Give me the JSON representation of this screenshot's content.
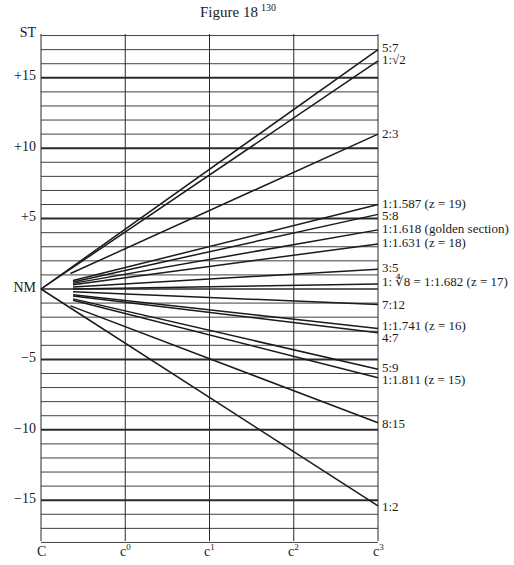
{
  "figure": {
    "title": "Figure 18",
    "page_number": "130"
  },
  "y_axis": {
    "labels": [
      {
        "text": "ST",
        "value": 18
      },
      {
        "text": "+15",
        "value": 15
      },
      {
        "text": "+10",
        "value": 10
      },
      {
        "text": "+5",
        "value": 5
      },
      {
        "text": "NM",
        "value": 0
      },
      {
        "text": "−5",
        "value": -5
      },
      {
        "text": "−10",
        "value": -10
      },
      {
        "text": "−15",
        "value": -15
      }
    ]
  },
  "x_axis": {
    "labels": [
      {
        "base": "C",
        "sup": ""
      },
      {
        "base": "c",
        "sup": "0"
      },
      {
        "base": "c",
        "sup": "1"
      },
      {
        "base": "c",
        "sup": "2"
      },
      {
        "base": "c",
        "sup": "3"
      }
    ]
  },
  "chart_data": {
    "type": "line",
    "title": "Figure 18",
    "xlabel": "",
    "ylabel": "",
    "x_ticks": [
      "C",
      "c0",
      "c1",
      "c2",
      "c3"
    ],
    "y_ticks": [
      "ST",
      "+15",
      "+10",
      "+5",
      "NM",
      "-5",
      "-10",
      "-15"
    ],
    "ylim": [
      -18,
      18
    ],
    "grid": true,
    "series": [
      {
        "name": "5:7",
        "start": [
          0,
          0
        ],
        "end": [
          4,
          17.0
        ]
      },
      {
        "name": "1:√2",
        "start": [
          0,
          0
        ],
        "end": [
          4,
          16.2
        ]
      },
      {
        "name": "2:3",
        "start": [
          0.35,
          1.1
        ],
        "end": [
          4,
          11.0
        ]
      },
      {
        "name": "1:1.587 (z = 19)",
        "start": [
          0.38,
          0.6
        ],
        "end": [
          4,
          6.0
        ]
      },
      {
        "name": "5:8",
        "start": [
          0.38,
          0.5
        ],
        "end": [
          4,
          5.3
        ]
      },
      {
        "name": "1:1.618 (golden section)",
        "start": [
          0.38,
          0.4
        ],
        "end": [
          4,
          4.2
        ]
      },
      {
        "name": "1:1.631 (z = 18)",
        "start": [
          0.38,
          0.3
        ],
        "end": [
          4,
          3.2
        ]
      },
      {
        "name": "3:5",
        "start": [
          0.38,
          0.15
        ],
        "end": [
          4,
          1.4
        ]
      },
      {
        "name": "1: ∜8 = 1:1.682 (z = 17)",
        "start": [
          0.38,
          0.0
        ],
        "end": [
          4,
          0.35
        ]
      },
      {
        "name": "7:12",
        "start": [
          0.38,
          -0.2
        ],
        "end": [
          4,
          -1.1
        ]
      },
      {
        "name": "1:1.741 (z = 16)",
        "start": [
          0.38,
          -0.4
        ],
        "end": [
          4,
          -2.8
        ]
      },
      {
        "name": "4:7",
        "start": [
          0.38,
          -0.5
        ],
        "end": [
          4,
          -3.1
        ]
      },
      {
        "name": "5:9",
        "start": [
          0.38,
          -0.7
        ],
        "end": [
          4,
          -5.7
        ]
      },
      {
        "name": "1:1.811 (z = 15)",
        "start": [
          0.38,
          -0.8
        ],
        "end": [
          4,
          -6.3
        ]
      },
      {
        "name": "8:15",
        "start": [
          0.35,
          -1.2
        ],
        "end": [
          4,
          -9.5
        ]
      },
      {
        "name": "1:2",
        "start": [
          0,
          0
        ],
        "end": [
          4,
          -15.4
        ]
      }
    ]
  },
  "right_labels": [
    {
      "text": "5:7",
      "y": 48
    },
    {
      "text": "1:√2",
      "y": 60
    },
    {
      "text": "2:3",
      "y": 134
    },
    {
      "text": "1:1.587 (z = 19)",
      "y": 204
    },
    {
      "text": "5:8",
      "y": 216
    },
    {
      "text": "1:1.618 (golden section)",
      "y": 229
    },
    {
      "text": "1:1.631 (z = 18)",
      "y": 243
    },
    {
      "text": "3:5",
      "y": 268
    },
    {
      "text": "1: ∜8 = 1:1.682 (z = 17)",
      "y": 282
    },
    {
      "text": "7:12",
      "y": 305
    },
    {
      "text": "1:1.741 (z = 16)",
      "y": 326
    },
    {
      "text": "4:7",
      "y": 338
    },
    {
      "text": "5:9",
      "y": 368
    },
    {
      "text": "1:1.811 (z = 15)",
      "y": 380
    },
    {
      "text": "8:15",
      "y": 424
    },
    {
      "text": "1:2",
      "y": 507
    }
  ]
}
